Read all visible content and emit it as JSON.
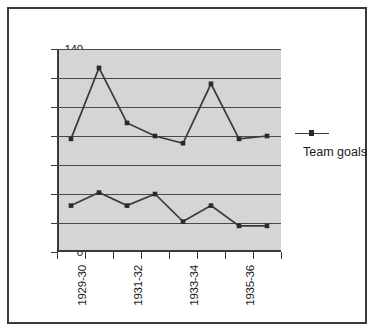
{
  "chart_data": {
    "type": "line",
    "title": "",
    "subtitle": "",
    "xlabel": "",
    "ylabel": "",
    "ylim": [
      0,
      140
    ],
    "ytick_step": 20,
    "yticks": [
      0,
      20,
      40,
      60,
      80,
      100,
      120,
      140
    ],
    "categories": [
      "1929-30",
      "1930-31",
      "1931-32",
      "1932-33",
      "1933-34",
      "1934-35",
      "1935-36",
      "1936-37"
    ],
    "visible_tick_labels": [
      "1929-30",
      "",
      "1931-32",
      "",
      "1933-34",
      "",
      "1935-36",
      ""
    ],
    "grid": "horizontal",
    "legend_position": "right",
    "series": [
      {
        "name": "Team goals",
        "values": [
          78,
          127,
          89,
          80,
          75,
          116,
          78,
          80
        ]
      },
      {
        "name": "Team goals",
        "values": [
          32,
          41,
          32,
          40,
          21,
          32,
          18,
          18
        ]
      }
    ]
  },
  "legend": {
    "entries": [
      {
        "label": "Team goals"
      }
    ]
  },
  "colors": {
    "plot_background": "#d5d5d5",
    "canvas_background": "#ffffff",
    "frame_border": "#3a3a3a",
    "gridline": "#4a4a4a",
    "series_line": "#3a3a3a",
    "marker": "#2a2a2a",
    "text": "#1a1a1a"
  }
}
